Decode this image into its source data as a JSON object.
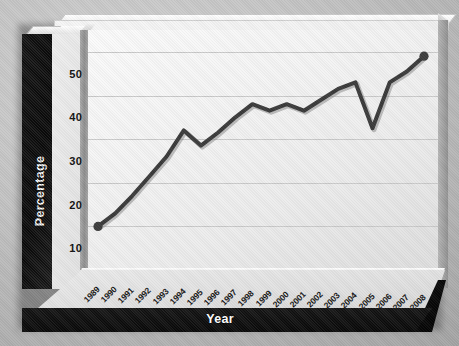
{
  "chart_data": {
    "type": "line",
    "title": "",
    "xlabel": "Year",
    "ylabel": "Percentage",
    "categories": [
      "1989",
      "1990",
      "1991",
      "1992",
      "1993",
      "1994",
      "1995",
      "1996",
      "1997",
      "1998",
      "1999",
      "2000",
      "2001",
      "2002",
      "2003",
      "2004",
      "2005",
      "2006",
      "2007",
      "2008"
    ],
    "values": [
      10,
      13,
      17,
      21.5,
      26,
      32,
      28.5,
      31.5,
      35,
      38,
      36.5,
      38,
      36.5,
      39,
      41.5,
      43,
      32.5,
      43,
      45.5,
      49
    ],
    "series": [
      {
        "name": "Percentage",
        "values": [
          10,
          13,
          17,
          21.5,
          26,
          32,
          28.5,
          31.5,
          35,
          38,
          36.5,
          38,
          36.5,
          39,
          41.5,
          43,
          32.5,
          43,
          45.5,
          49
        ]
      }
    ],
    "ylim": [
      0,
      55
    ],
    "yticks": [
      0,
      10,
      20,
      30,
      40,
      50
    ],
    "ytick_labels": [
      "0",
      "10",
      "20",
      "30",
      "40",
      "50"
    ],
    "xlim_labels": [
      "1989",
      "2008"
    ],
    "grid": true,
    "grid_axis": "y",
    "legend": false,
    "legend_position": "none",
    "markers": {
      "first_point": {
        "category": "1989",
        "value": 10
      },
      "last_point": {
        "category": "2008",
        "value": 49
      }
    },
    "style": {
      "line_color": "#3a3a3a",
      "line_width_px": 4,
      "marker_color": "#3a3a3a",
      "plot_background": "#f3f3f3",
      "grid_color": "#c9c9c9",
      "wall_color": "#101010",
      "axis_label_color": "#ffffff",
      "tick_label_color": "#111111",
      "page_background": "#bdbdbd"
    }
  }
}
